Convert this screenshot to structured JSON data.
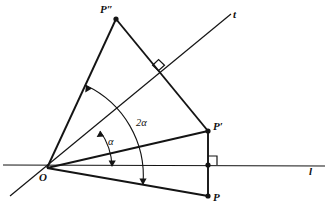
{
  "figure": {
    "type": "geometry-diagram",
    "canvas": {
      "width": 329,
      "height": 214,
      "background": "#ffffff"
    },
    "stroke_color": "#141414",
    "labels": {
      "origin": "O",
      "point_p": "P",
      "point_p_prime": "P′",
      "point_p_double_prime": "P″",
      "line_l": "l",
      "line_t": "t",
      "angle_alpha": "α",
      "angle_two_alpha": "2α"
    },
    "points": {
      "O": {
        "x": 47,
        "y": 168
      },
      "P": {
        "x": 208,
        "y": 196
      },
      "P_prime": {
        "x": 208,
        "y": 131
      },
      "P_double_prime": {
        "x": 116,
        "y": 19
      },
      "foot_on_l": {
        "x": 208,
        "y": 165
      },
      "foot_on_t": {
        "x": 158,
        "y": 71
      }
    },
    "lines": {
      "l": {
        "from": {
          "x": 3,
          "y": 165
        },
        "to": {
          "x": 325,
          "y": 166
        }
      },
      "t": {
        "from": {
          "x": 10,
          "y": 196
        },
        "to": {
          "x": 231,
          "y": 14
        }
      }
    },
    "segments": [
      {
        "name": "O-P",
        "from": "O",
        "to": "P"
      },
      {
        "name": "O-P-prime",
        "from": "O",
        "to": "P_prime"
      },
      {
        "name": "O-P-double-prime",
        "from": "O",
        "to": "P_double_prime"
      },
      {
        "name": "P-P-prime",
        "from": "P",
        "to": "P_prime"
      },
      {
        "name": "P-prime-P-double-prime",
        "from": "P_prime",
        "to": "P_double_prime"
      }
    ],
    "right_angle_markers": [
      {
        "name": "right-angle-at-line-l",
        "at": {
          "x": 208,
          "y": 165
        }
      },
      {
        "name": "right-angle-at-line-t",
        "at": {
          "x": 158,
          "y": 71
        }
      }
    ],
    "arcs": [
      {
        "name": "alpha-arc",
        "label": "α",
        "from_ray": "l",
        "to_ray": "t",
        "radius": 65
      },
      {
        "name": "two-alpha-arc",
        "label": "2α",
        "from_ray": "O-P-prime",
        "to_ray": "O-P-double-prime",
        "radius": 100
      }
    ],
    "label_positions": {
      "O": {
        "x": 40,
        "y": 172
      },
      "P": {
        "x": 213,
        "y": 193
      },
      "P_prime": {
        "x": 213,
        "y": 122
      },
      "P_double_prime": {
        "x": 100,
        "y": 5
      },
      "l": {
        "x": 309,
        "y": 166
      },
      "t": {
        "x": 233,
        "y": 9
      },
      "alpha": {
        "x": 108,
        "y": 137
      },
      "two_alpha": {
        "x": 137,
        "y": 118
      }
    }
  }
}
